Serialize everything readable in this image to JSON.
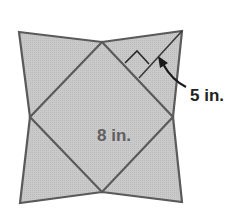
{
  "diagram": {
    "type": "geometry",
    "labels": {
      "slant_height": "5 in.",
      "inner_side": "8 in."
    },
    "colors": {
      "fill": "#c8c8c8",
      "stroke": "#5a5a5a",
      "text_dark": "#222222",
      "text_gray": "#606060"
    }
  }
}
